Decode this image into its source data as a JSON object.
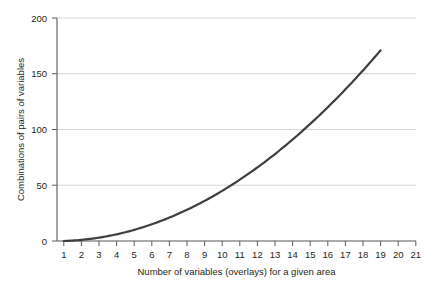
{
  "chart_data": {
    "type": "line",
    "title": "",
    "xlabel": "Number of variables (overlays) for a given area",
    "ylabel": "Combinations of pairs of variables",
    "xlim": [
      1,
      21
    ],
    "ylim": [
      0,
      200
    ],
    "grid": true,
    "legend": false,
    "line_color": "#3f3f3f",
    "grid_color": "#d4d4d4",
    "axis_color": "#58595b",
    "x_ticks": [
      1,
      2,
      3,
      4,
      5,
      6,
      7,
      8,
      9,
      10,
      11,
      12,
      13,
      14,
      15,
      16,
      17,
      18,
      19,
      20,
      21
    ],
    "y_ticks": [
      0,
      50,
      100,
      150,
      200
    ],
    "x_tick_labels": [
      "1",
      "2",
      "3",
      "4",
      "5",
      "6",
      "7",
      "8",
      "9",
      "10",
      "11",
      "12",
      "13",
      "14",
      "15",
      "16",
      "17",
      "18",
      "19",
      "20",
      "21"
    ],
    "y_tick_labels": [
      "0",
      "50",
      "100",
      "150",
      "200"
    ],
    "series": [
      {
        "name": "Combinations of pairs",
        "x": [
          1,
          2,
          3,
          4,
          5,
          6,
          7,
          8,
          9,
          10,
          11,
          12,
          13,
          14,
          15,
          16,
          17,
          18,
          19
        ],
        "values": [
          0,
          1,
          3,
          6,
          10,
          15,
          21,
          28,
          36,
          45,
          55,
          66,
          78,
          91,
          105,
          120,
          136,
          153,
          171
        ]
      }
    ]
  },
  "axis": {
    "x_title": "Number of variables (overlays) for a given area",
    "y_title": "Combinations of pairs of variables"
  }
}
